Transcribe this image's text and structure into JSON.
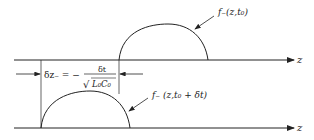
{
  "diagram": {
    "top_waveform_label": "f₋(z,t₀)",
    "bottom_waveform_label": "f₋ (z,t₀ + δt)",
    "top_axis_label": "z",
    "bottom_axis_label": "z",
    "displacement": {
      "lhs": "δz₋ = −",
      "numerator": "δt",
      "denominator": "L₀C₀",
      "sqrt_symbol": "√"
    },
    "stroke_color": "#222222",
    "background_color": "#ffffff"
  }
}
